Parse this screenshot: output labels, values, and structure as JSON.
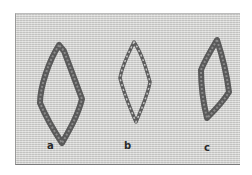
{
  "image": {
    "subject": "Three diamond-shaped embroidery stitch samples on woven fabric",
    "background_color": "#d6d6d4",
    "thread_color": "#5a5a5a"
  },
  "samples": [
    {
      "label": "a",
      "style": "thick fuzzy loop"
    },
    {
      "label": "b",
      "style": "thin twisted cord"
    },
    {
      "label": "c",
      "style": "thick fuzzy loop"
    }
  ]
}
